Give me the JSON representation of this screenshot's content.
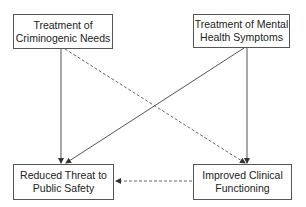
{
  "nodes": {
    "criminogenic": {
      "line1": "Treatment of",
      "line2": "Criminogenic Needs"
    },
    "mental_health": {
      "line1": "Treatment of Mental",
      "line2": "Health Symptoms"
    },
    "public_safety": {
      "line1": "Reduced Threat to",
      "line2": "Public Safety"
    },
    "clinical": {
      "line1": "Improved Clinical",
      "line2": "Functioning"
    }
  },
  "edges": [
    {
      "from": "criminogenic",
      "to": "public_safety",
      "style": "solid"
    },
    {
      "from": "criminogenic",
      "to": "clinical",
      "style": "dashed"
    },
    {
      "from": "mental_health",
      "to": "public_safety",
      "style": "solid"
    },
    {
      "from": "mental_health",
      "to": "clinical",
      "style": "solid"
    },
    {
      "from": "clinical",
      "to": "public_safety",
      "style": "dashed"
    }
  ]
}
